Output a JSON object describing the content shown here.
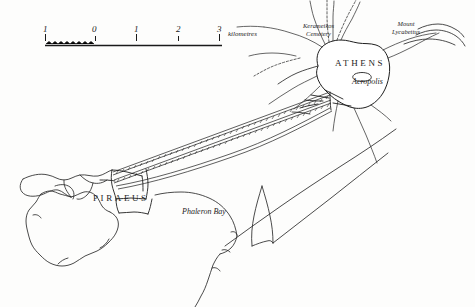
{
  "map": {
    "title": "Athens and Piraeus with the Long Walls",
    "background_color": "#fdfdfc",
    "ink_color": "#1f1f1f",
    "width": 475,
    "height": 307
  },
  "scale_bar": {
    "unit_label": "kilometres",
    "ticks": [
      {
        "label": "1",
        "x": 45
      },
      {
        "label": "0",
        "x": 95
      },
      {
        "label": "1",
        "x": 136
      },
      {
        "label": "2",
        "x": 178
      },
      {
        "label": "3",
        "x": 219
      }
    ],
    "bar_y": 44,
    "bar_x_start": 45,
    "bar_x_end": 222
  },
  "labels": {
    "athens": "ATHENS",
    "piraeus": "PIRAEUS",
    "acropolis": "Acropolis",
    "phaleron_bay": "Phaleron Bay",
    "kerameikos_line1": "Kerameikos",
    "kerameikos_line2": "Cemetery",
    "lycabettus_line1": "Mount",
    "lycabettus_line2": "Lycabettus"
  },
  "features": [
    {
      "name": "athens-city-wall",
      "kind": "fortification"
    },
    {
      "name": "piraeus-city-wall",
      "kind": "fortification"
    },
    {
      "name": "long-walls",
      "kind": "fortification"
    },
    {
      "name": "acropolis",
      "kind": "landmark"
    },
    {
      "name": "phaleron-bay",
      "kind": "water"
    },
    {
      "name": "piraeus-peninsula",
      "kind": "landmass"
    },
    {
      "name": "roads",
      "kind": "route"
    }
  ]
}
